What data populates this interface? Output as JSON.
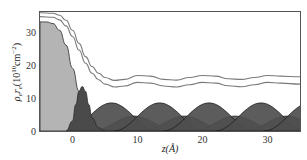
{
  "chart_data": {
    "type": "area",
    "title": "",
    "xlabel": "z(Å)",
    "ylabel": "ρ_e r_e (10^10 cm^-2)",
    "ylabel_parts": {
      "main": "ρ",
      "sub1": "e",
      "mid": "r",
      "sub2": "e",
      "open": "(10",
      "sup1": "10",
      "unit": "cm",
      "sup2": "−2",
      "close": ")"
    },
    "xlim": [
      -5,
      35
    ],
    "ylim": [
      0,
      36
    ],
    "xticks": [
      0,
      10,
      20,
      30
    ],
    "yticks": [
      0,
      10,
      20,
      30
    ],
    "xtick_labels": [
      "0",
      "10",
      "20",
      "30"
    ],
    "ytick_labels": [
      "0",
      "10",
      "20",
      "30"
    ],
    "grid": false,
    "legend": null,
    "series": [
      {
        "name": "outer profile (line)",
        "style": "line",
        "color": "#7a7a7a",
        "x": [
          -5,
          -3,
          -2,
          -1,
          0,
          1,
          2,
          3,
          4,
          5,
          6.5,
          8,
          10,
          12,
          14,
          16,
          18,
          20,
          22,
          24,
          26,
          28,
          30,
          32,
          35
        ],
        "values": [
          35.8,
          35.6,
          35.0,
          33.5,
          30.5,
          26.5,
          22.5,
          19.5,
          17.5,
          16.2,
          15.3,
          15.6,
          16.8,
          16.6,
          15.6,
          15.4,
          16.2,
          16.8,
          16.6,
          15.8,
          15.6,
          16.2,
          16.8,
          16.6,
          16.4
        ]
      },
      {
        "name": "inner profile (line)",
        "style": "line",
        "color": "#7a7a7a",
        "x": [
          -5,
          -3,
          -2,
          -1,
          0,
          1,
          2,
          3,
          4,
          5,
          6.5,
          8,
          10,
          12,
          14,
          16,
          18,
          20,
          22,
          24,
          26,
          28,
          30,
          32,
          35
        ],
        "values": [
          34.6,
          34.4,
          33.6,
          31.8,
          28.6,
          24.5,
          20.5,
          17.5,
          15.5,
          14.2,
          13.3,
          13.6,
          14.7,
          14.5,
          13.6,
          13.3,
          14.0,
          14.7,
          14.5,
          13.7,
          13.4,
          14.0,
          14.7,
          14.5,
          14.2
        ]
      },
      {
        "name": "substrate density (filled, light)",
        "style": "fill",
        "color": "#b4b4b4",
        "x": [
          -5,
          -4,
          -3,
          -2,
          -1,
          0,
          1,
          2,
          3,
          4,
          5
        ],
        "values": [
          33.0,
          33.0,
          32.5,
          30.5,
          26.0,
          19.0,
          12.0,
          6.5,
          2.5,
          0.5,
          0.0
        ]
      },
      {
        "name": "interface peak (filled, dark)",
        "style": "fill",
        "color": "#4a4a4a",
        "x": [
          -1,
          0,
          0.5,
          1,
          1.5,
          2,
          2.5,
          3,
          4,
          5
        ],
        "values": [
          0.0,
          3.0,
          8.0,
          12.0,
          13.5,
          12.0,
          8.0,
          4.0,
          1.0,
          0.0
        ]
      },
      {
        "name": "layer humps A (filled)",
        "style": "humps",
        "color": "#4e4e4e",
        "centers": [
          6.0,
          13.4,
          21.0,
          29.0,
          36.5
        ],
        "amplitude": 8.5,
        "half_width": 7.0
      },
      {
        "name": "layer humps B (filled, lower)",
        "style": "humps",
        "color": "#5a5a5a",
        "centers": [
          9.5,
          17.2,
          25.0,
          33.0
        ],
        "amplitude": 4.5,
        "half_width": 6.5
      }
    ]
  }
}
